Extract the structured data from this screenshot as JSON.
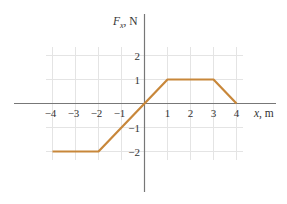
{
  "chart_data": {
    "type": "line",
    "title": "",
    "xlabel": "x, m",
    "ylabel": "F_x, N",
    "xlim": [
      -4,
      4
    ],
    "ylim": [
      -2,
      2
    ],
    "x_ticks": [
      -4,
      -3,
      -2,
      -1,
      1,
      2,
      3,
      4
    ],
    "x_tick_labels": [
      "−4",
      "−3",
      "−2",
      "−1",
      "1",
      "2",
      "3",
      "4"
    ],
    "y_ticks": [
      2,
      1,
      -1,
      -2
    ],
    "y_tick_labels": [
      "2",
      "1",
      "−1",
      "−2"
    ],
    "grid": true,
    "legend": null,
    "series": [
      {
        "name": "F_x(x)",
        "color": "#C8873A",
        "x": [
          -4,
          -2,
          0,
          1,
          3,
          4
        ],
        "y": [
          -2,
          -2,
          0,
          1,
          1,
          0
        ]
      }
    ]
  },
  "labels": {
    "y_axis_main": "F",
    "y_axis_sub": "x",
    "y_axis_unit": ", N",
    "x_axis": "x, m"
  },
  "colors": {
    "line": "#C8873A",
    "axis": "#777777",
    "grid": "#E4E4E4"
  }
}
